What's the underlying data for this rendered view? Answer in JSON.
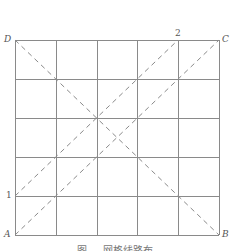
{
  "diagram": {
    "grid": {
      "cols": 5,
      "rows": 5,
      "x0": 15,
      "y0": 40,
      "x1": 219,
      "y1": 235,
      "line_color": "#8a8a8a",
      "dash_color": "#8a8a8a"
    },
    "corners": {
      "A": {
        "label": "A",
        "x": 15,
        "y": 235
      },
      "B": {
        "label": "B",
        "x": 219,
        "y": 235
      },
      "C": {
        "label": "C",
        "x": 219,
        "y": 40
      },
      "D": {
        "label": "D",
        "x": 15,
        "y": 40
      }
    },
    "points": {
      "p1": {
        "label": "1",
        "x": 15,
        "y": 196
      },
      "p2": {
        "label": "2",
        "x": 178,
        "y": 40
      }
    },
    "dashed_lines": [
      {
        "from": "D",
        "to": "B"
      },
      {
        "from": "A",
        "to": "C"
      },
      {
        "from": "1",
        "to": "2"
      }
    ],
    "caption": "图 — 网格线路布"
  }
}
